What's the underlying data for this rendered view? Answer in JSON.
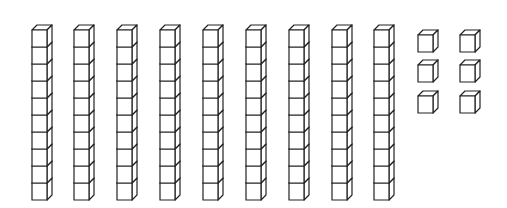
{
  "diagram": {
    "type": "base-ten-blocks",
    "tens_rods": 9,
    "cubes_per_rod": 10,
    "unit_cubes": 6,
    "represented_value": 96,
    "rods": [
      {
        "x": 32
      },
      {
        "x": 74
      },
      {
        "x": 117
      },
      {
        "x": 160
      },
      {
        "x": 203
      },
      {
        "x": 246
      },
      {
        "x": 289
      },
      {
        "x": 332
      },
      {
        "x": 374
      }
    ],
    "units": [
      {
        "x": 418,
        "y": 30
      },
      {
        "x": 460,
        "y": 30
      },
      {
        "x": 418,
        "y": 60
      },
      {
        "x": 460,
        "y": 60
      },
      {
        "x": 418,
        "y": 91
      },
      {
        "x": 460,
        "y": 91
      }
    ],
    "colors": {
      "stroke": "#222222",
      "fill": "#ffffff"
    }
  }
}
